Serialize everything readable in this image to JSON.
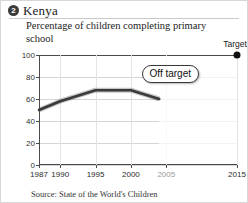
{
  "card": {
    "badge_number": "2",
    "title": "Kenya",
    "subtitle": "Percentage of children completing primary school",
    "source": "Source: State of the World's Children"
  },
  "annotations": {
    "target_label": "Target",
    "status_label": "Off target"
  },
  "colors": {
    "line": "#3a3a3a",
    "axis": "#4a4a4a",
    "grid": "#d5d5d5",
    "badge": "#3b3b3b",
    "target_dot": "#111111"
  },
  "chart_data": {
    "type": "line",
    "title": "Percentage of children completing primary school",
    "subtitle": "Kenya",
    "xlabel": "",
    "ylabel": "",
    "xlim": [
      1987,
      2015
    ],
    "ylim": [
      0,
      100
    ],
    "yticks": [
      0,
      20,
      40,
      60,
      80,
      100
    ],
    "xticks": [
      1987,
      1990,
      1995,
      2000,
      2005,
      2015
    ],
    "xtick_labels": [
      "1987",
      "1990",
      "1995",
      "2000",
      "2005",
      "2015"
    ],
    "grid": true,
    "legend": "none",
    "series": [
      {
        "name": "Children completing primary school",
        "x": [
          1987,
          1990,
          1995,
          2000,
          2004
        ],
        "values": [
          50,
          58,
          68,
          68,
          60
        ]
      }
    ],
    "target_point": {
      "x": 2015,
      "y": 100,
      "label": "Target"
    },
    "annotation": {
      "text": "Off target",
      "x": 2008,
      "y": 84
    },
    "projection_boundary_year": 2004
  }
}
